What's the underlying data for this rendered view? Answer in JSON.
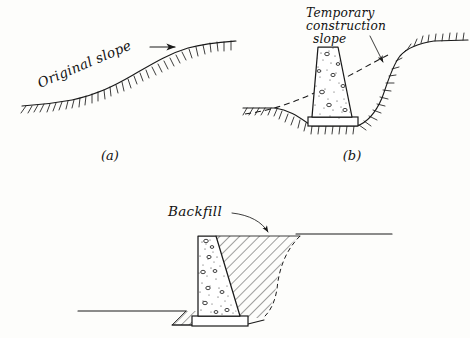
{
  "figure": {
    "background_color": "#fdfdfb",
    "ink_color": "#1a1a1a",
    "panels": [
      {
        "id": "a",
        "caption": "(a)",
        "annotation": "Original slope",
        "description": "Natural ground surface rising from left to right, drawn as a hatched ground line"
      },
      {
        "id": "b",
        "caption": "(b)",
        "annotation_lines": [
          "Temporary",
          "construction",
          "slope"
        ],
        "description": "Excavated cut with concrete retaining wall on spread footing; dashed line shows original ground surface"
      },
      {
        "id": "c",
        "caption": "",
        "annotation": "Backfill",
        "description": "Completed wall with excavation backfilled; dashed line shows the temporary construction slope face"
      }
    ],
    "labels": {
      "original_slope": "Original slope",
      "temporary_line1": "Temporary",
      "temporary_line2": "construction",
      "temporary_line3": "slope",
      "backfill": "Backfill",
      "caption_a": "(a)",
      "caption_b": "(b)"
    }
  }
}
